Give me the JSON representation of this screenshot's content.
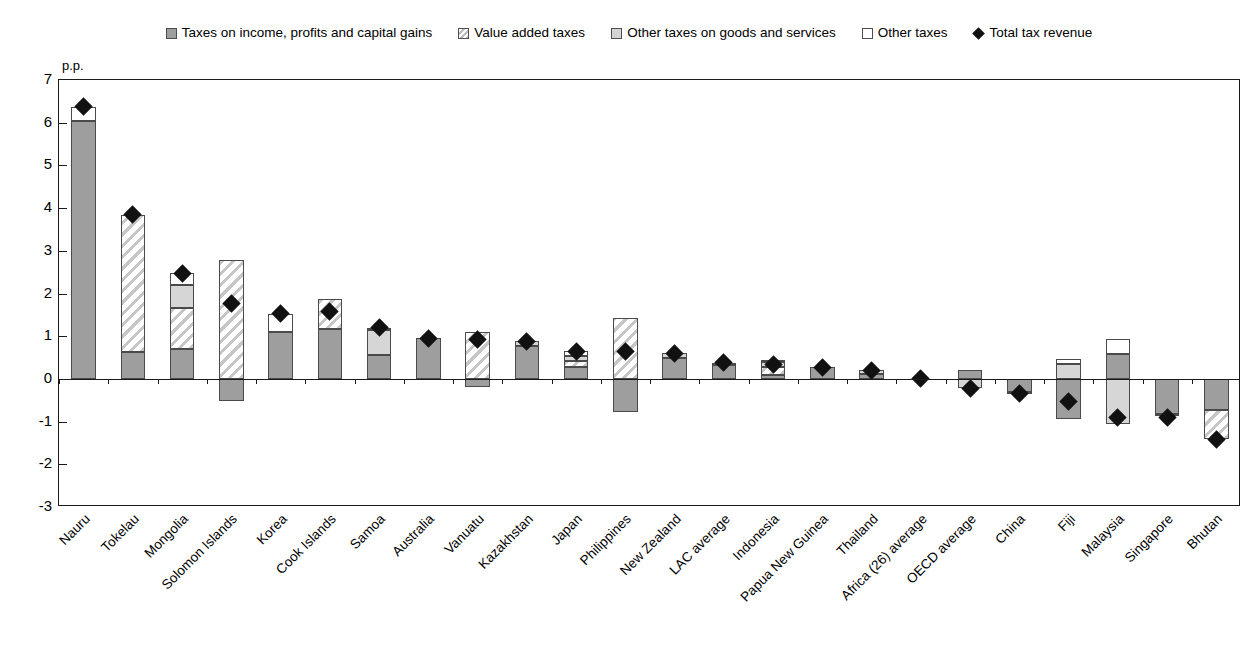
{
  "legend": {
    "items": [
      {
        "label": "Taxes on income, profits and capital gains",
        "icon": "square-gray-swatch",
        "key": "income"
      },
      {
        "label": "Value added taxes",
        "icon": "square-hatched-swatch",
        "key": "vat"
      },
      {
        "label": "Other taxes on goods and services",
        "icon": "square-lightgray-swatch",
        "key": "goods"
      },
      {
        "label": "Other taxes",
        "icon": "square-white-swatch",
        "key": "other"
      },
      {
        "label": "Total tax revenue",
        "icon": "diamond-marker",
        "key": "total"
      }
    ]
  },
  "axis": {
    "y_unit_label": "p.p.",
    "y_ticks": [
      "7",
      "6",
      "5",
      "4",
      "3",
      "2",
      "1",
      "0",
      "-1",
      "-2",
      "-3"
    ]
  },
  "chart_data": {
    "type": "bar",
    "title": "",
    "subtitle": "",
    "xlabel": "",
    "ylabel": "p.p.",
    "ylim": [
      -3,
      7
    ],
    "grid": false,
    "stacked": true,
    "legend_position": "top-center",
    "categories": [
      "Nauru",
      "Tokelau",
      "Mongolia",
      "Solomon Islands",
      "Korea",
      "Cook Islands",
      "Samoa",
      "Australia",
      "Vanuatu",
      "Kazakhstan",
      "Japan",
      "Philippines",
      "New Zealand",
      "LAC average",
      "Indonesia",
      "Papua New Guinea",
      "Thailand",
      "Africa (26) average",
      "OECD average",
      "China",
      "Fiji",
      "Malaysia",
      "Singapore",
      "Bhutan"
    ],
    "series": [
      {
        "name": "Taxes on income, profits and capital gains",
        "values": [
          6.05,
          0.62,
          0.7,
          -0.52,
          1.1,
          1.16,
          0.57,
          0.95,
          -0.18,
          0.76,
          0.28,
          -0.78,
          0.48,
          0.33,
          0.1,
          0.27,
          0.12,
          0.0,
          0.22,
          -0.3,
          -0.95,
          0.58,
          -0.82,
          -0.73
        ]
      },
      {
        "name": "Value added taxes",
        "values": [
          0.0,
          3.22,
          0.95,
          2.78,
          0.0,
          0.72,
          0.0,
          0.0,
          1.1,
          0.0,
          0.15,
          1.42,
          0.0,
          0.0,
          0.17,
          0.0,
          0.0,
          0.0,
          0.0,
          0.0,
          0.0,
          0.0,
          0.0,
          -0.68
        ]
      },
      {
        "name": "Other taxes on goods and services",
        "values": [
          0.0,
          0.0,
          0.55,
          0.0,
          0.0,
          0.0,
          0.58,
          0.0,
          0.0,
          0.12,
          0.1,
          0.0,
          0.12,
          0.0,
          0.12,
          0.0,
          0.08,
          0.0,
          -0.22,
          -0.05,
          0.35,
          -1.05,
          -0.05,
          0.0
        ]
      },
      {
        "name": "Other taxes",
        "values": [
          0.32,
          0.0,
          0.28,
          0.0,
          0.42,
          0.0,
          0.05,
          0.0,
          0.0,
          0.0,
          0.12,
          0.0,
          0.0,
          0.05,
          0.05,
          0.0,
          0.0,
          0.0,
          0.0,
          0.0,
          0.12,
          0.35,
          0.0,
          0.0
        ]
      }
    ],
    "total_marker": {
      "name": "Total tax revenue",
      "values": [
        6.37,
        3.84,
        2.48,
        1.76,
        1.52,
        1.57,
        1.2,
        0.95,
        0.92,
        0.88,
        0.65,
        0.64,
        0.6,
        0.38,
        0.34,
        0.27,
        0.2,
        0.0,
        -0.22,
        -0.35,
        -0.52,
        -0.9,
        -0.9,
        -1.41
      ]
    }
  },
  "colors": {
    "income": "#9e9e9e",
    "vat": "#ffffff",
    "goods": "#d6d6d6",
    "other": "#ffffff",
    "marker": "#111111",
    "axis": "#1a1a1a"
  }
}
